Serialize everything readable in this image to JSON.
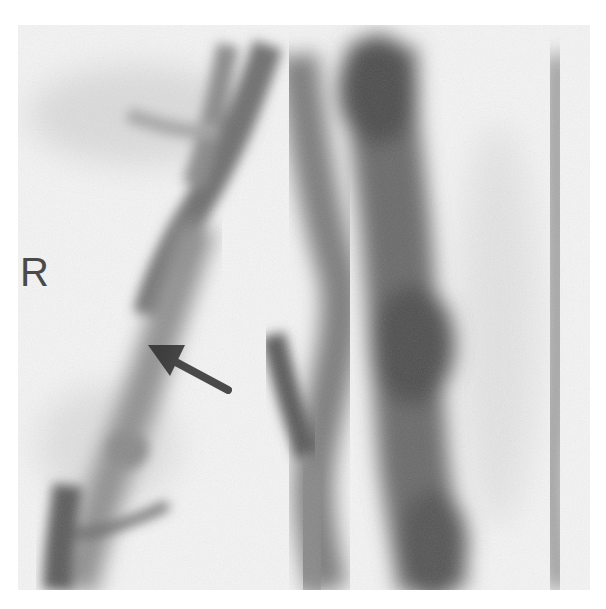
{
  "image": {
    "kind": "grayscale angiographic radiograph",
    "side_marker": "R",
    "annotation": "arrow",
    "colors": {
      "background": "#ffffff",
      "film": "#f4f4f4",
      "vessel_dark": "#4a4a4a",
      "vessel_mid": "#7a7a7a",
      "vessel_light": "#a8a8a8",
      "arrow": "#2e2e2e",
      "label": "#4a4a4a"
    }
  }
}
